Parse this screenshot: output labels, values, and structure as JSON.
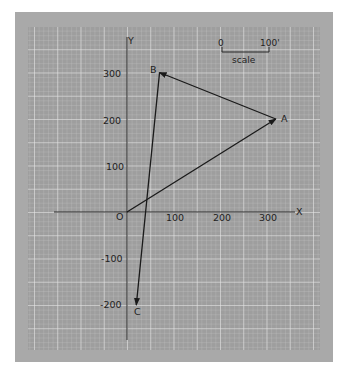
{
  "figure": {
    "axes": {
      "x_label": "X",
      "y_label": "Y",
      "origin_label": "O",
      "x_ticks": [
        {
          "value": 100,
          "label": "100"
        },
        {
          "value": 200,
          "label": "200"
        },
        {
          "value": 300,
          "label": "300"
        }
      ],
      "y_ticks": [
        {
          "value": 300,
          "label": "300"
        },
        {
          "value": 200,
          "label": "200"
        },
        {
          "value": 100,
          "label": "100"
        },
        {
          "value": -100,
          "label": "-100"
        },
        {
          "value": -200,
          "label": "-200"
        }
      ]
    },
    "scale_bar": {
      "start_label": "0",
      "end_label": "100'",
      "caption": "scale"
    },
    "points": [
      {
        "name": "O",
        "x": 0,
        "y": 0
      },
      {
        "name": "A",
        "x": 320,
        "y": 200
      },
      {
        "name": "B",
        "x": 70,
        "y": 300
      },
      {
        "name": "C",
        "x": 20,
        "y": -200
      }
    ],
    "vectors": [
      {
        "from": "O",
        "to": "A"
      },
      {
        "from": "A",
        "to": "B"
      },
      {
        "from": "B",
        "to": "C"
      }
    ],
    "colors": {
      "frame": "#a9a9a9",
      "grid_bg": "#9e9e9e",
      "grid_minor": "#bdbdbd",
      "grid_major": "#e6e6e6",
      "ink": "#1a1a1a"
    }
  }
}
